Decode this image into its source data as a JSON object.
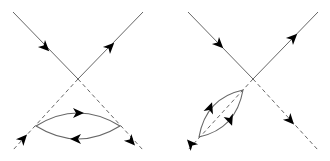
{
  "figure": {
    "colors": {
      "line": "#666666",
      "arrow": "#000000",
      "background": "#ffffff"
    },
    "diagrams": [
      {
        "id": "left",
        "vertex": [
          78,
          79
        ],
        "solid_lines": [
          [
            [
              13,
              12
            ],
            [
              78,
              79
            ]
          ],
          [
            [
              143,
              12
            ],
            [
              78,
              79
            ]
          ]
        ],
        "dashed_lines": [
          [
            [
              78,
              79
            ],
            [
              13,
              150
            ]
          ],
          [
            [
              78,
              79
            ],
            [
              143,
              150
            ]
          ]
        ],
        "loop": {
          "left": [
            36,
            126
          ],
          "right": [
            120,
            126
          ],
          "top_ctrl": [
            78,
            100
          ],
          "bottom_ctrl": [
            78,
            152
          ]
        },
        "arrows": [
          {
            "at": [
              45,
              47
            ],
            "angle": 45
          },
          {
            "at": [
              110,
              47
            ],
            "angle": -45
          },
          {
            "at": [
              78,
              113
            ],
            "angle": 0
          },
          {
            "at": [
              76,
              139
            ],
            "angle": 180
          },
          {
            "at": [
              23,
              139
            ],
            "angle": -48
          },
          {
            "at": [
              131,
              141
            ],
            "angle": 48
          }
        ]
      },
      {
        "id": "right",
        "vertex": [
          253,
          79
        ],
        "solid_lines": [
          [
            [
              188,
              12
            ],
            [
              253,
              79
            ]
          ],
          [
            [
              318,
              12
            ],
            [
              253,
              79
            ]
          ]
        ],
        "dashed_lines": [
          [
            [
              253,
              79
            ],
            [
              188,
              150
            ]
          ],
          [
            [
              253,
              79
            ],
            [
              318,
              150
            ]
          ]
        ],
        "loop": {
          "a": [
            243,
            90
          ],
          "b": [
            199,
            137
          ],
          "ctrl1": [
            206,
            98
          ],
          "ctrl2": [
            236,
            129
          ]
        },
        "arrows": [
          {
            "at": [
              219,
              44
            ],
            "angle": 45
          },
          {
            "at": [
              293,
              38
            ],
            "angle": -45
          },
          {
            "at": [
              290,
              120
            ],
            "angle": 48
          },
          {
            "at": [
              191,
              144
            ],
            "angle": 228
          },
          {
            "at": [
              210,
              108
            ],
            "angle": -70
          },
          {
            "at": [
              230,
              120
            ],
            "angle": 70
          }
        ]
      }
    ]
  }
}
